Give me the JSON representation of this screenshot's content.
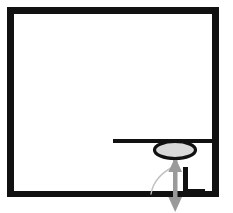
{
  "figure": {
    "type": "line-diagram",
    "background_color": "#ffffff",
    "stroke_color": "#111111",
    "accent_color": "#9a9a9a",
    "fill_color": "#d8d8d8",
    "width": 233,
    "height": 213
  },
  "elements": {
    "enclosure": {
      "name": "enclosure-frame",
      "description": "Thick black rectangular outline forming the walls of the chamber",
      "left": 7,
      "top": 7,
      "right": 219,
      "bottom": 197,
      "wall_thickness": 7,
      "color": "#111111"
    },
    "shelf": {
      "name": "horizontal-shelf",
      "description": "Horizontal black bar spanning from mid-chamber to the right wall",
      "x_start": 113,
      "x_end": 219,
      "y": 141,
      "thickness": 4,
      "color": "#111111"
    },
    "disc": {
      "name": "disc-ellipse",
      "description": "Light gray filled ellipse with heavy black outline resting on the shelf",
      "center_x": 175,
      "center_y": 150,
      "radius_x": 20,
      "radius_y": 8,
      "fill": "#d8d8d8",
      "stroke": "#111111",
      "stroke_width": 3
    },
    "notch": {
      "name": "floor-step-notch",
      "description": "L-shaped step riser in the floor to the right of the arrow",
      "riser_x": 185,
      "riser_top": 167,
      "riser_bottom": 197,
      "thickness": 5,
      "color": "#111111"
    },
    "travel_arrow": {
      "name": "vertical-travel-arrow",
      "description": "Gray double-headed arrow indicating vertical travel of the disc",
      "x": 175,
      "y_top": 158,
      "y_bottom": 211,
      "shaft_width": 4,
      "head_width": 13,
      "head_length": 13,
      "color": "#9a9a9a",
      "heads": "double"
    },
    "leader": {
      "name": "curved-leader-line",
      "description": "Thin curved leader line sweeping from lower left up to the arrow shaft",
      "start_x": 152,
      "start_y": 193,
      "end_x": 175,
      "end_y": 166,
      "color": "#bdbdbd",
      "stroke_width": 1
    }
  },
  "labels": {
    "figure_caption": "",
    "annotations": []
  }
}
